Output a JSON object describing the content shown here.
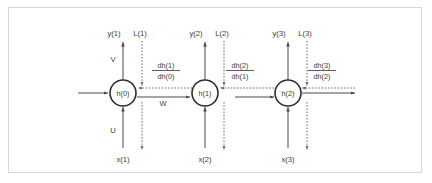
{
  "figure": {
    "border_color": "#d8d8d8",
    "background": "#ffffff",
    "solid_color": "#4a4a4a",
    "dashed_color": "#6b6b6b",
    "node_stroke": "#2e2e2e",
    "text_color": "#3b3b3b"
  },
  "nodes": [
    {
      "id": "h0",
      "label": "h(0)",
      "cx": 123,
      "cy": 93,
      "r": 13
    },
    {
      "id": "h1",
      "label": "h(1)",
      "cx": 205,
      "cy": 93,
      "r": 13
    },
    {
      "id": "h2",
      "label": "h(2)",
      "cx": 288,
      "cy": 93,
      "r": 13
    }
  ],
  "outputs": [
    {
      "label": "y(1)",
      "x": 114,
      "y": 36
    },
    {
      "label": "y(2)",
      "x": 196,
      "y": 36
    },
    {
      "label": "y(3)",
      "x": 279,
      "y": 36
    }
  ],
  "losses": [
    {
      "label": "L(1)",
      "x": 138,
      "y": 36
    },
    {
      "label": "L(2)",
      "x": 220,
      "y": 36
    },
    {
      "label": "L(3)",
      "x": 303,
      "y": 36
    }
  ],
  "inputs": [
    {
      "label": "x(1)",
      "x": 114,
      "y": 159
    },
    {
      "label": "x(2)",
      "x": 196,
      "y": 159
    },
    {
      "label": "x(3)",
      "x": 279,
      "y": 159
    }
  ],
  "weights": [
    {
      "label": "V",
      "x": 109,
      "y": 60
    },
    {
      "label": "U",
      "x": 109,
      "y": 131
    },
    {
      "label": "W",
      "x": 163,
      "y": 104
    }
  ],
  "gradients": [
    {
      "numerator": "dh(1)",
      "denominator": "dh(0)",
      "x": 166,
      "y_num": 66,
      "y_bar": 69,
      "y_den": 77
    },
    {
      "numerator": "dh(2)",
      "denominator": "dh(1)",
      "x": 240,
      "y_num": 66,
      "y_bar": 69,
      "y_den": 77
    },
    {
      "numerator": "dh(3)",
      "denominator": "dh(2)",
      "x": 322,
      "y_num": 66,
      "y_bar": 69,
      "y_den": 77
    }
  ],
  "edges": {
    "left_entry_arrow": "solid arrow entering h(0) from the left",
    "h0_to_h1": "solid rightward arrow labelled W",
    "h1_to_h2": "solid rightward arrow with dotted continuation gap",
    "h2_to_right": "solid rightward arrow exiting h(2)",
    "backward_dashed": "dashed leftward gradient arrows"
  }
}
